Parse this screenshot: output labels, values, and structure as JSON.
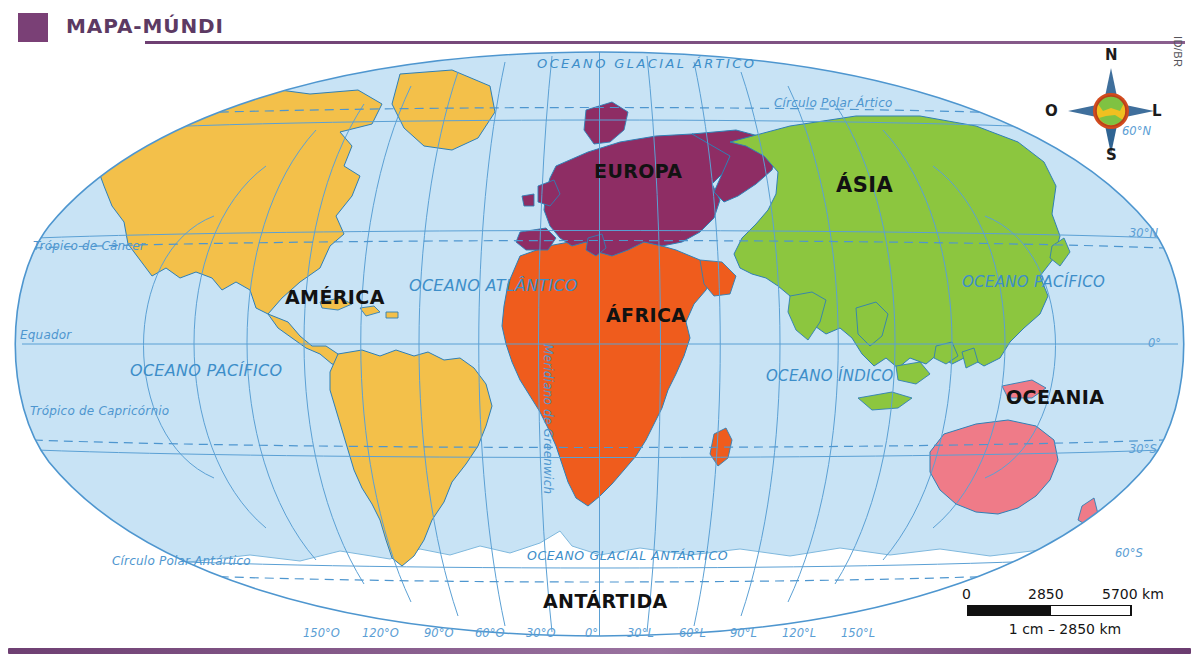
{
  "header": {
    "title": "MAPA-MÚNDI",
    "accent_color": "#7a4076",
    "credit": "ID/BR"
  },
  "map": {
    "ocean_fill": "#c8e3f5",
    "graticule_color": "#5ba0d4",
    "continents": [
      {
        "name": "AMÉRICA",
        "color": "#f3c04a"
      },
      {
        "name": "EUROPA",
        "color": "#8e2d64"
      },
      {
        "name": "ÁSIA",
        "color": "#8cc63f"
      },
      {
        "name": "ÁFRICA",
        "color": "#ef5c1d"
      },
      {
        "name": "OCEANIA",
        "color": "#ef7b88"
      },
      {
        "name": "ANTÁRTIDA",
        "color": "#ffffff"
      }
    ],
    "oceans": [
      {
        "name": "OCEANO GLACIAL ÁRTICO"
      },
      {
        "name": "OCEANO ATLÂNTICO"
      },
      {
        "name": "OCEANO PACÍFICO"
      },
      {
        "name": "OCEANO ÍNDICO"
      },
      {
        "name": "OCEANO GLACIAL ANTÁRTICO"
      }
    ],
    "reference_lines": [
      {
        "label": "Círculo Polar Ártico"
      },
      {
        "label": "Trópico de Câncer"
      },
      {
        "label": "Equador"
      },
      {
        "label": "Trópico de Capricórnio"
      },
      {
        "label": "Círculo Polar Antártico"
      },
      {
        "label": "Meridiano de Greenwich"
      }
    ],
    "latitude_labels": [
      "60°N",
      "30°N",
      "0°",
      "30°S",
      "60°S"
    ],
    "longitude_labels": [
      "150°O",
      "120°O",
      "90°O",
      "60°O",
      "30°O",
      "0°",
      "30°L",
      "60°L",
      "90°L",
      "120°L",
      "150°L"
    ]
  },
  "compass": {
    "north": "N",
    "south": "S",
    "west": "O",
    "east": "L"
  },
  "scale": {
    "ticks": [
      "0",
      "2850",
      "5700 km"
    ],
    "caption": "1 cm – 2850 km"
  }
}
